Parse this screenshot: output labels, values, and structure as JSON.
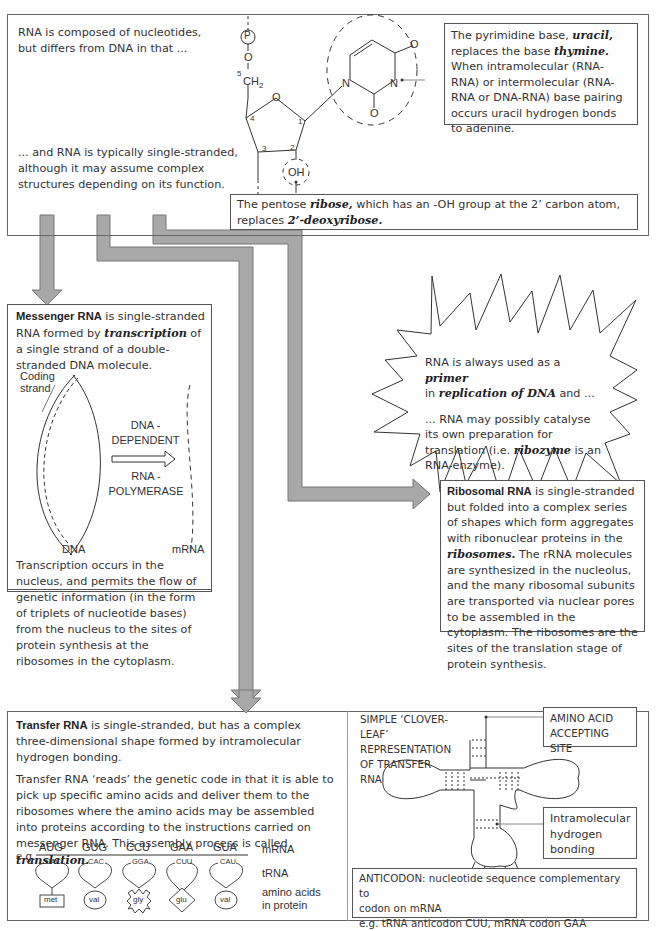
{
  "top_panel": {
    "intro": "RNA is composed of nucleotides, but differs from DNA in that ...",
    "single_stranded": "... and RNA is typically single-stranded, although it may assume complex structures depending on its function.",
    "uracil_note": {
      "p1": "The pyrimidine base, ",
      "b1": "uracil,",
      "p2": " replaces the base ",
      "b2": "thymine.",
      "p3": "  When intramolecular (RNA-RNA) or intermolecular (RNA-RNA or DNA-RNA) base pairing occurs uracil hydrogen bonds to adenine."
    },
    "ribose_note": {
      "p1": "The pentose ",
      "b1": "ribose,",
      "p2": " which has an -OH group at the 2’ carbon atom, replaces ",
      "b2": "2’-deoxyribose."
    },
    "structure_labels": {
      "phosphate": "P",
      "oxygen": "O",
      "c5": "5",
      "ch2": "CH",
      "ch2_sub": "2",
      "ring_o": "O",
      "c1": "1",
      "c2": "2",
      "c3": "3",
      "c4": "4",
      "oh": "OH",
      "n1": "N",
      "n3": "N",
      "o_top": "O",
      "o_bottom": "O"
    }
  },
  "mrna_box": {
    "title": "Messenger RNA",
    "p1": " is single-stranded RNA formed by ",
    "b1": "transcription",
    "p2": " of a single strand of a double-stranded DNA molecule.",
    "coding_strand": [
      "Coding",
      "strand"
    ],
    "enzyme": [
      "DNA -",
      "DEPENDENT",
      "RNA -",
      "POLYMERASE"
    ],
    "dna_label": "DNA",
    "mrna_label": "mRNA",
    "bottom": "Transcription occurs in the nucleus, and permits the flow of genetic information (in the form of triplets of nucleotide bases) from the nucleus to the sites of protein synthesis at the ribosomes in the cytoplasm."
  },
  "starburst": {
    "p1": "RNA is always used as a ",
    "b1": "primer",
    "p2": "in ",
    "b2": "replication of DNA",
    "p3": " and ...",
    "p4": "... RNA may possibly catalyse its own preparation for translation (i.e. ",
    "b3": "ribozyme",
    "p5": " is an RNA-enzyme)."
  },
  "rrna_box": {
    "title": "Ribosomal RNA",
    "p1": " is single-stranded but folded into a complex series of shapes which form aggregates with ribonuclear proteins in the ",
    "b1": "ribosomes.",
    "p2": " The rRNA molecules are synthesized in the nucleolus, and the many ribosomal subunits are transported via nuclear pores to be assembled in the cytoplasm.  The ribosomes are the sites of the translation stage of protein synthesis."
  },
  "trna_box": {
    "title": "Transfer RNA",
    "p1": " is single-stranded, but has a complex three-dimensional shape formed by intramolecular hydrogen bonding.",
    "p2": "Transfer RNA ‘reads’ the genetic code in that it is able to pick up specific amino acids and deliver them to the ribosomes where the amino acids may be assembled into proteins according to the instructions carried on messenger RNA.  This assembly process is called ",
    "b1": "translation.",
    "eg": "e.g.",
    "codons": [
      "AUG",
      "GUG",
      "CCU",
      "GAA",
      "GUA"
    ],
    "anticodons": [
      "UAC",
      "CAC",
      "GGA",
      "CUU",
      "CAU"
    ],
    "amino_acids": [
      "met",
      "val",
      "gly",
      "glu",
      "val"
    ],
    "row_labels": {
      "mrna": "mRNA",
      "trna": "tRNA",
      "amino": [
        "amino acids",
        "in protein"
      ]
    }
  },
  "cloverleaf": {
    "title": [
      "SIMPLE ‘CLOVER-",
      "LEAF’",
      "REPRESENTATION",
      "OF TRANSFER",
      "RNA"
    ],
    "amino_site": [
      "AMINO ACID",
      "ACCEPTING SITE"
    ],
    "hbond": [
      "Intramolecular",
      "hydrogen",
      "bonding"
    ],
    "anticodon": [
      "ANTICODON: nucleotide sequence complementary to",
      "codon on mRNA",
      "e.g. tRNA anticodon CUU, mRNA codon GAA"
    ]
  },
  "colors": {
    "arrow_fill": "#a8a8a8",
    "arrow_stroke": "#777777",
    "box_border": "#555555",
    "text": "#333333"
  }
}
